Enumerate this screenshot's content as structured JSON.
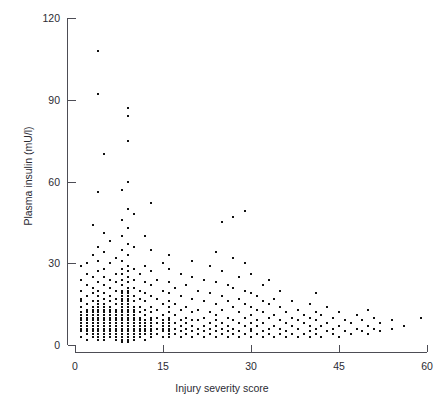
{
  "caption": "Plasma insulin level vs injury severity score",
  "chart_data": {
    "type": "scatter",
    "title": "",
    "xlabel": "Injury severity score",
    "ylabel": "Plasma insulin (mU/l)",
    "xlim": [
      0,
      60
    ],
    "ylim": [
      0,
      120
    ],
    "xticks": [
      0,
      15,
      30,
      45,
      60
    ],
    "yticks": [
      0,
      30,
      60,
      90,
      120
    ],
    "xtick_labels": [
      "0",
      "15",
      "30",
      "45",
      "60"
    ],
    "ytick_labels": [
      "0",
      "30",
      "60",
      "90",
      "120"
    ],
    "grid": false,
    "legend": null,
    "marker": {
      "shape": "square",
      "size_px": 2,
      "color": "#111111"
    },
    "axis_style": "offset-L-axes",
    "n_points": 470,
    "points": [
      [
        1,
        3
      ],
      [
        1,
        5
      ],
      [
        1,
        6
      ],
      [
        1,
        7
      ],
      [
        1,
        8
      ],
      [
        1,
        9
      ],
      [
        1,
        10
      ],
      [
        1,
        11
      ],
      [
        1,
        12
      ],
      [
        1,
        14
      ],
      [
        1,
        16
      ],
      [
        1,
        17
      ],
      [
        1,
        20
      ],
      [
        1,
        24
      ],
      [
        1,
        29
      ],
      [
        2,
        2
      ],
      [
        2,
        4
      ],
      [
        2,
        5
      ],
      [
        2,
        6
      ],
      [
        2,
        7
      ],
      [
        2,
        8
      ],
      [
        2,
        9
      ],
      [
        2,
        10
      ],
      [
        2,
        11
      ],
      [
        2,
        12
      ],
      [
        2,
        13
      ],
      [
        2,
        15
      ],
      [
        2,
        18
      ],
      [
        2,
        22
      ],
      [
        2,
        26
      ],
      [
        2,
        30
      ],
      [
        3,
        3
      ],
      [
        3,
        4
      ],
      [
        3,
        5
      ],
      [
        3,
        6
      ],
      [
        3,
        7
      ],
      [
        3,
        8
      ],
      [
        3,
        9
      ],
      [
        3,
        10
      ],
      [
        3,
        11
      ],
      [
        3,
        12
      ],
      [
        3,
        13
      ],
      [
        3,
        14
      ],
      [
        3,
        16
      ],
      [
        3,
        19
      ],
      [
        3,
        21
      ],
      [
        3,
        25
      ],
      [
        3,
        33
      ],
      [
        3,
        44
      ],
      [
        4,
        2
      ],
      [
        4,
        3
      ],
      [
        4,
        4
      ],
      [
        4,
        5
      ],
      [
        4,
        6
      ],
      [
        4,
        7
      ],
      [
        4,
        8
      ],
      [
        4,
        9
      ],
      [
        4,
        10
      ],
      [
        4,
        11
      ],
      [
        4,
        12
      ],
      [
        4,
        13
      ],
      [
        4,
        14
      ],
      [
        4,
        15
      ],
      [
        4,
        16
      ],
      [
        4,
        18
      ],
      [
        4,
        20
      ],
      [
        4,
        23
      ],
      [
        4,
        27
      ],
      [
        4,
        31
      ],
      [
        4,
        36
      ],
      [
        4,
        56
      ],
      [
        4,
        92
      ],
      [
        4,
        108
      ],
      [
        5,
        2
      ],
      [
        5,
        3
      ],
      [
        5,
        4
      ],
      [
        5,
        5
      ],
      [
        5,
        6
      ],
      [
        5,
        7
      ],
      [
        5,
        8
      ],
      [
        5,
        9
      ],
      [
        5,
        10
      ],
      [
        5,
        11
      ],
      [
        5,
        12
      ],
      [
        5,
        13
      ],
      [
        5,
        14
      ],
      [
        5,
        15
      ],
      [
        5,
        17
      ],
      [
        5,
        19
      ],
      [
        5,
        22
      ],
      [
        5,
        25
      ],
      [
        5,
        28
      ],
      [
        5,
        34
      ],
      [
        5,
        41
      ],
      [
        5,
        70
      ],
      [
        6,
        3
      ],
      [
        6,
        4
      ],
      [
        6,
        5
      ],
      [
        6,
        6
      ],
      [
        6,
        7
      ],
      [
        6,
        8
      ],
      [
        6,
        9
      ],
      [
        6,
        10
      ],
      [
        6,
        11
      ],
      [
        6,
        12
      ],
      [
        6,
        13
      ],
      [
        6,
        14
      ],
      [
        6,
        16
      ],
      [
        6,
        18
      ],
      [
        6,
        21
      ],
      [
        6,
        24
      ],
      [
        6,
        30
      ],
      [
        6,
        38
      ],
      [
        7,
        2
      ],
      [
        7,
        3
      ],
      [
        7,
        4
      ],
      [
        7,
        5
      ],
      [
        7,
        6
      ],
      [
        7,
        7
      ],
      [
        7,
        8
      ],
      [
        7,
        9
      ],
      [
        7,
        10
      ],
      [
        7,
        11
      ],
      [
        7,
        12
      ],
      [
        7,
        13
      ],
      [
        7,
        15
      ],
      [
        7,
        17
      ],
      [
        7,
        20
      ],
      [
        7,
        23
      ],
      [
        7,
        26
      ],
      [
        7,
        32
      ],
      [
        8,
        1
      ],
      [
        8,
        2
      ],
      [
        8,
        3
      ],
      [
        8,
        4
      ],
      [
        8,
        5
      ],
      [
        8,
        6
      ],
      [
        8,
        7
      ],
      [
        8,
        8
      ],
      [
        8,
        9
      ],
      [
        8,
        10
      ],
      [
        8,
        11
      ],
      [
        8,
        12
      ],
      [
        8,
        13
      ],
      [
        8,
        14
      ],
      [
        8,
        15
      ],
      [
        8,
        16
      ],
      [
        8,
        17
      ],
      [
        8,
        18
      ],
      [
        8,
        19
      ],
      [
        8,
        20
      ],
      [
        8,
        22
      ],
      [
        8,
        24
      ],
      [
        8,
        26
      ],
      [
        8,
        28
      ],
      [
        8,
        31
      ],
      [
        8,
        35
      ],
      [
        8,
        40
      ],
      [
        8,
        46
      ],
      [
        8,
        57
      ],
      [
        9,
        1
      ],
      [
        9,
        2
      ],
      [
        9,
        3
      ],
      [
        9,
        4
      ],
      [
        9,
        5
      ],
      [
        9,
        6
      ],
      [
        9,
        7
      ],
      [
        9,
        8
      ],
      [
        9,
        9
      ],
      [
        9,
        10
      ],
      [
        9,
        11
      ],
      [
        9,
        12
      ],
      [
        9,
        13
      ],
      [
        9,
        14
      ],
      [
        9,
        15
      ],
      [
        9,
        16
      ],
      [
        9,
        17
      ],
      [
        9,
        18
      ],
      [
        9,
        19
      ],
      [
        9,
        20
      ],
      [
        9,
        21
      ],
      [
        9,
        23
      ],
      [
        9,
        25
      ],
      [
        9,
        27
      ],
      [
        9,
        29
      ],
      [
        9,
        33
      ],
      [
        9,
        37
      ],
      [
        9,
        43
      ],
      [
        9,
        50
      ],
      [
        9,
        60
      ],
      [
        9,
        75
      ],
      [
        9,
        84
      ],
      [
        9,
        87
      ],
      [
        10,
        2
      ],
      [
        10,
        3
      ],
      [
        10,
        4
      ],
      [
        10,
        5
      ],
      [
        10,
        6
      ],
      [
        10,
        7
      ],
      [
        10,
        8
      ],
      [
        10,
        9
      ],
      [
        10,
        10
      ],
      [
        10,
        11
      ],
      [
        10,
        12
      ],
      [
        10,
        13
      ],
      [
        10,
        14
      ],
      [
        10,
        16
      ],
      [
        10,
        18
      ],
      [
        10,
        21
      ],
      [
        10,
        24
      ],
      [
        10,
        28
      ],
      [
        10,
        36
      ],
      [
        10,
        48
      ],
      [
        11,
        3
      ],
      [
        11,
        4
      ],
      [
        11,
        5
      ],
      [
        11,
        6
      ],
      [
        11,
        7
      ],
      [
        11,
        8
      ],
      [
        11,
        9
      ],
      [
        11,
        10
      ],
      [
        11,
        12
      ],
      [
        11,
        14
      ],
      [
        11,
        17
      ],
      [
        11,
        20
      ],
      [
        11,
        26
      ],
      [
        12,
        2
      ],
      [
        12,
        4
      ],
      [
        12,
        5
      ],
      [
        12,
        6
      ],
      [
        12,
        7
      ],
      [
        12,
        8
      ],
      [
        12,
        9
      ],
      [
        12,
        11
      ],
      [
        12,
        13
      ],
      [
        12,
        16
      ],
      [
        12,
        19
      ],
      [
        12,
        23
      ],
      [
        12,
        29
      ],
      [
        12,
        40
      ],
      [
        13,
        3
      ],
      [
        13,
        4
      ],
      [
        13,
        5
      ],
      [
        13,
        6
      ],
      [
        13,
        7
      ],
      [
        13,
        8
      ],
      [
        13,
        9
      ],
      [
        13,
        10
      ],
      [
        13,
        12
      ],
      [
        13,
        14
      ],
      [
        13,
        18
      ],
      [
        13,
        22
      ],
      [
        13,
        27
      ],
      [
        13,
        35
      ],
      [
        13,
        52
      ],
      [
        14,
        4
      ],
      [
        14,
        6
      ],
      [
        14,
        8
      ],
      [
        14,
        10
      ],
      [
        14,
        13
      ],
      [
        14,
        17
      ],
      [
        14,
        24
      ],
      [
        15,
        3
      ],
      [
        15,
        5
      ],
      [
        15,
        6
      ],
      [
        15,
        7
      ],
      [
        15,
        8
      ],
      [
        15,
        9
      ],
      [
        15,
        11
      ],
      [
        15,
        15
      ],
      [
        15,
        20
      ],
      [
        15,
        30
      ],
      [
        16,
        3
      ],
      [
        16,
        4
      ],
      [
        16,
        5
      ],
      [
        16,
        6
      ],
      [
        16,
        7
      ],
      [
        16,
        8
      ],
      [
        16,
        9
      ],
      [
        16,
        10
      ],
      [
        16,
        12
      ],
      [
        16,
        14
      ],
      [
        16,
        16
      ],
      [
        16,
        19
      ],
      [
        16,
        23
      ],
      [
        16,
        28
      ],
      [
        16,
        33
      ],
      [
        17,
        4
      ],
      [
        17,
        6
      ],
      [
        17,
        8
      ],
      [
        17,
        11
      ],
      [
        17,
        15
      ],
      [
        17,
        21
      ],
      [
        18,
        3
      ],
      [
        18,
        5
      ],
      [
        18,
        7
      ],
      [
        18,
        9
      ],
      [
        18,
        13
      ],
      [
        18,
        18
      ],
      [
        18,
        26
      ],
      [
        19,
        4
      ],
      [
        19,
        6
      ],
      [
        19,
        8
      ],
      [
        19,
        10
      ],
      [
        19,
        14
      ],
      [
        19,
        22
      ],
      [
        20,
        3
      ],
      [
        20,
        5
      ],
      [
        20,
        7
      ],
      [
        20,
        9
      ],
      [
        20,
        12
      ],
      [
        20,
        17
      ],
      [
        20,
        25
      ],
      [
        20,
        31
      ],
      [
        21,
        4
      ],
      [
        21,
        6
      ],
      [
        21,
        9
      ],
      [
        21,
        13
      ],
      [
        21,
        20
      ],
      [
        22,
        3
      ],
      [
        22,
        5
      ],
      [
        22,
        7
      ],
      [
        22,
        10
      ],
      [
        22,
        16
      ],
      [
        22,
        24
      ],
      [
        23,
        4
      ],
      [
        23,
        6
      ],
      [
        23,
        8
      ],
      [
        23,
        12
      ],
      [
        23,
        19
      ],
      [
        23,
        29
      ],
      [
        24,
        3
      ],
      [
        24,
        5
      ],
      [
        24,
        7
      ],
      [
        24,
        9
      ],
      [
        24,
        11
      ],
      [
        24,
        15
      ],
      [
        24,
        23
      ],
      [
        24,
        34
      ],
      [
        25,
        4
      ],
      [
        25,
        6
      ],
      [
        25,
        8
      ],
      [
        25,
        13
      ],
      [
        25,
        18
      ],
      [
        25,
        27
      ],
      [
        25,
        45
      ],
      [
        26,
        3
      ],
      [
        26,
        5
      ],
      [
        26,
        7
      ],
      [
        26,
        10
      ],
      [
        26,
        16
      ],
      [
        26,
        22
      ],
      [
        27,
        4
      ],
      [
        27,
        6
      ],
      [
        27,
        9
      ],
      [
        27,
        14
      ],
      [
        27,
        21
      ],
      [
        27,
        32
      ],
      [
        27,
        47
      ],
      [
        28,
        3
      ],
      [
        28,
        5
      ],
      [
        28,
        8
      ],
      [
        28,
        12
      ],
      [
        28,
        17
      ],
      [
        28,
        25
      ],
      [
        29,
        4
      ],
      [
        29,
        7
      ],
      [
        29,
        10
      ],
      [
        29,
        15
      ],
      [
        29,
        20
      ],
      [
        29,
        30
      ],
      [
        29,
        49
      ],
      [
        30,
        3
      ],
      [
        30,
        5
      ],
      [
        30,
        6
      ],
      [
        30,
        8
      ],
      [
        30,
        11
      ],
      [
        30,
        14
      ],
      [
        30,
        19
      ],
      [
        30,
        26
      ],
      [
        31,
        4
      ],
      [
        31,
        7
      ],
      [
        31,
        9
      ],
      [
        31,
        13
      ],
      [
        31,
        18
      ],
      [
        32,
        3
      ],
      [
        32,
        5
      ],
      [
        32,
        8
      ],
      [
        32,
        12
      ],
      [
        32,
        16
      ],
      [
        32,
        22
      ],
      [
        33,
        4
      ],
      [
        33,
        6
      ],
      [
        33,
        10
      ],
      [
        33,
        15
      ],
      [
        33,
        24
      ],
      [
        34,
        3
      ],
      [
        34,
        7
      ],
      [
        34,
        11
      ],
      [
        34,
        17
      ],
      [
        35,
        4
      ],
      [
        35,
        6
      ],
      [
        35,
        9
      ],
      [
        35,
        14
      ],
      [
        35,
        20
      ],
      [
        36,
        3
      ],
      [
        36,
        5
      ],
      [
        36,
        8
      ],
      [
        36,
        12
      ],
      [
        37,
        4
      ],
      [
        37,
        7
      ],
      [
        37,
        10
      ],
      [
        37,
        16
      ],
      [
        38,
        3
      ],
      [
        38,
        6
      ],
      [
        38,
        9
      ],
      [
        38,
        13
      ],
      [
        39,
        4
      ],
      [
        39,
        8
      ],
      [
        39,
        11
      ],
      [
        40,
        3
      ],
      [
        40,
        5
      ],
      [
        40,
        7
      ],
      [
        40,
        10
      ],
      [
        40,
        15
      ],
      [
        41,
        4
      ],
      [
        41,
        6
      ],
      [
        41,
        9
      ],
      [
        41,
        12
      ],
      [
        41,
        19
      ],
      [
        42,
        3
      ],
      [
        42,
        7
      ],
      [
        42,
        11
      ],
      [
        43,
        5
      ],
      [
        43,
        8
      ],
      [
        43,
        14
      ],
      [
        44,
        4
      ],
      [
        44,
        6
      ],
      [
        44,
        10
      ],
      [
        45,
        3
      ],
      [
        45,
        7
      ],
      [
        45,
        12
      ],
      [
        46,
        5
      ],
      [
        46,
        9
      ],
      [
        47,
        4
      ],
      [
        47,
        8
      ],
      [
        48,
        6
      ],
      [
        48,
        11
      ],
      [
        49,
        5
      ],
      [
        49,
        9
      ],
      [
        50,
        4
      ],
      [
        50,
        7
      ],
      [
        50,
        13
      ],
      [
        51,
        6
      ],
      [
        51,
        10
      ],
      [
        52,
        5
      ],
      [
        52,
        8
      ],
      [
        54,
        6
      ],
      [
        54,
        9
      ],
      [
        56,
        7
      ],
      [
        59,
        10
      ]
    ]
  }
}
